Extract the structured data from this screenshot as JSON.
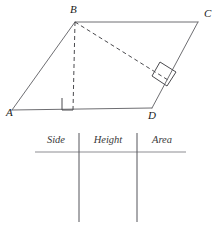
{
  "figure": {
    "shape_name": "parallelogram",
    "vertices": [
      {
        "label": "A",
        "x": 12,
        "y": 110,
        "label_x": 6,
        "label_y": 116
      },
      {
        "label": "B",
        "x": 75,
        "y": 22,
        "label_x": 70,
        "label_y": 13
      },
      {
        "label": "C",
        "x": 198,
        "y": 22,
        "label_x": 204,
        "label_y": 17
      },
      {
        "label": "D",
        "x": 152,
        "y": 108,
        "label_x": 148,
        "label_y": 119
      }
    ],
    "solid_edges": [
      {
        "name": "edge-AB",
        "x1": 12,
        "y1": 110,
        "x2": 75,
        "y2": 22
      },
      {
        "name": "edge-BC",
        "x1": 75,
        "y1": 22,
        "x2": 198,
        "y2": 22
      },
      {
        "name": "edge-CD",
        "x1": 198,
        "y1": 22,
        "x2": 152,
        "y2": 108
      },
      {
        "name": "edge-AD",
        "x1": 12,
        "y1": 110,
        "x2": 152,
        "y2": 108
      }
    ],
    "dashed_segments": [
      {
        "name": "height-from-B-to-AD",
        "x1": 75,
        "y1": 22,
        "x2": 73,
        "y2": 110
      },
      {
        "name": "height-from-B-to-DC",
        "x1": 75,
        "y1": 22,
        "x2": 168,
        "y2": 80
      }
    ],
    "right_angle_markers": [
      {
        "name": "right-angle-at-base",
        "points": "62,98 62,110 73,110"
      },
      {
        "name": "right-angle-at-side",
        "points": "160,62 176,72 167,86 152,76"
      }
    ],
    "line_color": "#6e6e72",
    "dash_color": "#4a4a4e",
    "label_color": "#1a1a1a"
  },
  "table": {
    "name": "measurements-table",
    "columns": [
      {
        "label": "Side",
        "center_x": 56
      },
      {
        "label": "Height",
        "center_x": 108
      },
      {
        "label": "Area",
        "center_x": 162
      }
    ],
    "header_y": 143,
    "header_rule": {
      "x1": 35,
      "y1": 152,
      "x2": 186,
      "y2": 152
    },
    "column_dividers": [
      {
        "name": "divider-side-height",
        "x": 79,
        "y1": 133,
        "y2": 222
      },
      {
        "name": "divider-height-area",
        "x": 137,
        "y1": 133,
        "y2": 222
      }
    ],
    "rule_color": "#8d8d92",
    "divider_color": "#55555a",
    "header_color": "#3a3a3a"
  }
}
